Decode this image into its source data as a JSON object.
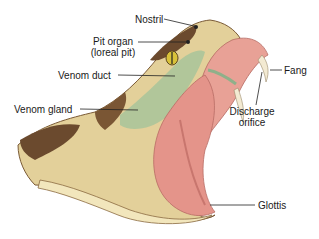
{
  "diagram": {
    "labels": {
      "nostril": "Nostril",
      "pit_organ_line1": "Pit organ",
      "pit_organ_line2": "(loreal pit)",
      "venom_duct": "Venom duct",
      "venom_gland": "Venom gland",
      "fang": "Fang",
      "discharge_line1": "Discharge",
      "discharge_line2": "orifice",
      "glottis": "Glottis"
    },
    "colors": {
      "mouth": "#e89a90",
      "mouth_dark": "#c9706a",
      "scale_light": "#e8d9a0",
      "scale_dark": "#6b4a2e",
      "gland_green": "#9fbf8f",
      "fang": "#f3ead2",
      "leader_line": "#222222"
    }
  }
}
